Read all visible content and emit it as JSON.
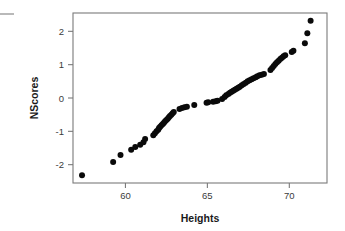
{
  "figure": {
    "background_color": "#ffffff",
    "point_color": "#0a0a0a",
    "frame_color": "#7a7a7a",
    "corner_mark_color": "#b9b9b9"
  },
  "chart_data": {
    "type": "scatter",
    "title": "",
    "subtitle": "",
    "xlabel": "Heights",
    "ylabel": "NScores",
    "xlim": [
      56.8,
      72.3
    ],
    "ylim": [
      -2.55,
      2.55
    ],
    "xticks": [
      60,
      65,
      70
    ],
    "xtick_labels": [
      "60",
      "65",
      "70"
    ],
    "yticks": [
      -2,
      -1,
      0,
      1,
      2
    ],
    "ytick_labels": [
      "-2",
      "-1",
      "0",
      "1",
      "2"
    ],
    "grid": false,
    "legend": null,
    "legend_position": "none",
    "marker": "filled-circle",
    "marker_size_px": 3.6,
    "annotations": [],
    "series": [
      {
        "name": "Normal Q-Q of Heights",
        "x": [
          57.35,
          59.25,
          59.7,
          60.35,
          60.6,
          60.9,
          61.1,
          61.2,
          61.7,
          61.8,
          61.9,
          62.0,
          62.05,
          62.12,
          62.2,
          62.28,
          62.35,
          62.42,
          62.5,
          62.58,
          62.65,
          62.72,
          62.8,
          62.88,
          62.95,
          63.3,
          63.45,
          63.6,
          63.75,
          64.2,
          64.95,
          65.05,
          65.35,
          65.5,
          65.62,
          65.9,
          66.05,
          66.15,
          66.28,
          66.38,
          66.48,
          66.58,
          66.68,
          66.78,
          66.88,
          66.98,
          67.1,
          67.22,
          67.34,
          67.46,
          67.58,
          67.7,
          67.82,
          67.95,
          68.05,
          68.18,
          68.32,
          68.45,
          68.85,
          68.95,
          69.05,
          69.15,
          69.25,
          69.35,
          69.45,
          69.55,
          69.65,
          69.75,
          70.15,
          70.25,
          70.95,
          71.1,
          71.3
        ],
        "y": [
          -2.32,
          -1.92,
          -1.71,
          -1.55,
          -1.47,
          -1.4,
          -1.33,
          -1.23,
          -1.12,
          -1.06,
          -1.0,
          -0.95,
          -0.9,
          -0.86,
          -0.82,
          -0.78,
          -0.74,
          -0.7,
          -0.66,
          -0.62,
          -0.58,
          -0.54,
          -0.5,
          -0.46,
          -0.42,
          -0.33,
          -0.3,
          -0.28,
          -0.26,
          -0.21,
          -0.14,
          -0.13,
          -0.11,
          -0.1,
          -0.08,
          -0.03,
          0.03,
          0.08,
          0.12,
          0.16,
          0.19,
          0.22,
          0.25,
          0.28,
          0.31,
          0.34,
          0.38,
          0.42,
          0.46,
          0.5,
          0.53,
          0.56,
          0.59,
          0.62,
          0.65,
          0.68,
          0.7,
          0.72,
          0.84,
          0.9,
          0.96,
          1.02,
          1.07,
          1.12,
          1.17,
          1.21,
          1.25,
          1.28,
          1.38,
          1.42,
          1.64,
          1.94,
          2.32
        ]
      }
    ]
  },
  "axes_geometry": {
    "plot_left_px": 73,
    "plot_right_px": 327,
    "plot_top_px": 13,
    "plot_bottom_px": 183
  }
}
